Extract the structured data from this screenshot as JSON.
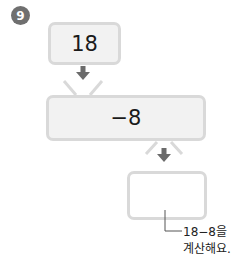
{
  "problem": {
    "number": "9",
    "start_value": "18",
    "operation": "−8",
    "result_value": "",
    "hint_line1": "18−8을",
    "hint_line2": "계산해요."
  },
  "colors": {
    "badge": "#6f6f6f",
    "box_border": "#d9d9d9",
    "box_fill": "#f2f2f2",
    "arrow": "#6b6b6b"
  }
}
